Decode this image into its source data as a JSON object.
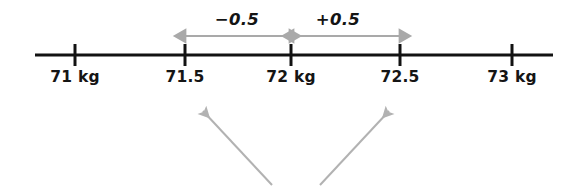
{
  "figure": {
    "type": "number-line-diagram",
    "background_color": "#ffffff",
    "axis": {
      "color": "#121212",
      "x_start": 35,
      "x_end": 553,
      "y": 55,
      "thickness": 3,
      "tick_half_height": 11,
      "tick_thickness": 3
    },
    "ticks": [
      {
        "label": "71 kg",
        "value": 71,
        "x": 75
      },
      {
        "label": "71.5",
        "value": 71.5,
        "x": 185
      },
      {
        "label": "72 kg",
        "value": 72,
        "x": 291
      },
      {
        "label": "72.5",
        "value": 72.5,
        "x": 400
      },
      {
        "label": "73 kg",
        "value": 73,
        "x": 512
      }
    ],
    "tick_label_y": 68,
    "measure_arrows": {
      "color": "#a9a9a9",
      "thickness": 2,
      "y": 36,
      "items": [
        {
          "label": "-0.5",
          "label_text": "−0.5",
          "from_x": 186,
          "to_x": 289,
          "label_x": 237,
          "label_y": 10,
          "double_headed": true
        },
        {
          "label": "+0.5",
          "label_text": "+0.5",
          "from_x": 294,
          "to_x": 399,
          "label_x": 338,
          "label_y": 10,
          "double_headed": true
        }
      ]
    },
    "pointer_arrows": {
      "color": "#b2b2b2",
      "thickness": 2,
      "items": [
        {
          "name": "pointer-arrow-left",
          "tail_x": 272,
          "tail_y": 185,
          "tip_x": 203,
          "tip_y": 111
        },
        {
          "name": "pointer-arrow-right",
          "tail_x": 320,
          "tail_y": 185,
          "tip_x": 389,
          "tip_y": 111
        }
      ]
    }
  }
}
